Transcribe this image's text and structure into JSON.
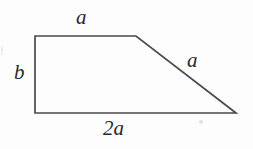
{
  "figure": {
    "kind": "geometry-diagram",
    "canvas": {
      "width": 253,
      "height": 149,
      "background": "#fdfdfd"
    },
    "stroke": {
      "color": "#4a4a4a",
      "width": 1.7
    },
    "shape": {
      "name": "trapezoid",
      "vertices": [
        {
          "name": "top-left",
          "x": 35,
          "y": 36
        },
        {
          "name": "top-right",
          "x": 136,
          "y": 36
        },
        {
          "name": "bottom-right",
          "x": 236,
          "y": 113
        },
        {
          "name": "bottom-left",
          "x": 35,
          "y": 113
        }
      ],
      "points_attr": "35,36 136,36 236,113 35,113"
    },
    "labels": {
      "top": "a",
      "left": "b",
      "slant": "a",
      "bottom": "2a"
    }
  }
}
